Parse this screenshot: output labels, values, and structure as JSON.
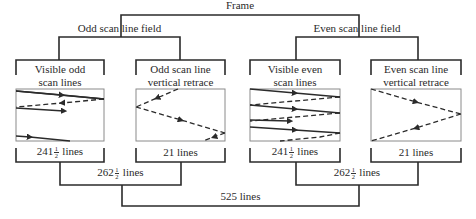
{
  "diagram": {
    "frame": {
      "label": "Frame"
    },
    "fields": [
      {
        "label": "Odd scan line field",
        "parts": [
          {
            "label_line1": "Visible odd",
            "label_line2": "scan lines",
            "count_whole": "241",
            "count_num": "1",
            "count_den": "2",
            "count_unit": "lines",
            "pattern": "visible-odd"
          },
          {
            "label_line1": "Odd scan line",
            "label_line2": "vertical retrace",
            "count_text": "21 lines",
            "pattern": "retrace-odd"
          }
        ],
        "total_whole": "262",
        "total_num": "1",
        "total_den": "2",
        "total_unit": "lines"
      },
      {
        "label": "Even scan line field",
        "parts": [
          {
            "label_line1": "Visible even",
            "label_line2": "scan lines",
            "count_whole": "241",
            "count_num": "1",
            "count_den": "2",
            "count_unit": "lines",
            "pattern": "visible-even"
          },
          {
            "label_line1": "Even scan line",
            "label_line2": "vertical retrace",
            "count_text": "21 lines",
            "pattern": "retrace-even"
          }
        ],
        "total_whole": "262",
        "total_num": "1",
        "total_den": "2",
        "total_unit": "lines"
      }
    ],
    "grand_total": "525 lines",
    "colors": {
      "line": "#2b2b2b",
      "box_border": "#8a8a8a",
      "text": "#2a2a2a"
    }
  }
}
